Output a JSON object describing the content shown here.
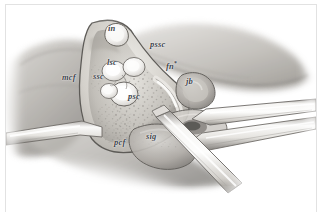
{
  "figure": {
    "style": "grayscale medical illustration",
    "border_color": "#e2e2e2",
    "background_color": "#ffffff"
  },
  "labels": [
    {
      "id": "in",
      "text": "in",
      "meaning": "incus",
      "x": 108,
      "y": 24
    },
    {
      "id": "pssc",
      "text": "pssc",
      "meaning": "posterior semicircular canal",
      "x": 150,
      "y": 40
    },
    {
      "id": "lsc",
      "text": "lsc",
      "meaning": "lateral semicircular canal",
      "x": 107,
      "y": 58
    },
    {
      "id": "mcf",
      "text": "mcf",
      "meaning": "middle cranial fossa",
      "x": 62,
      "y": 73
    },
    {
      "id": "ssc",
      "text": "ssc",
      "meaning": "superior semicircular canal",
      "x": 93,
      "y": 72
    },
    {
      "id": "fn",
      "text": "fn",
      "sup": "*",
      "meaning": "facial nerve",
      "x": 166,
      "y": 62
    },
    {
      "id": "jb",
      "text": "jb",
      "meaning": "jugular bulb",
      "x": 186,
      "y": 77
    },
    {
      "id": "psc",
      "text": "psc",
      "meaning": "posterior semicircular canal",
      "x": 128,
      "y": 92
    },
    {
      "id": "pcf",
      "text": "pcf",
      "meaning": "posterior cranial fossa",
      "x": 114,
      "y": 138
    },
    {
      "id": "sig",
      "text": "sig",
      "meaning": "sigmoid sinus",
      "x": 146,
      "y": 132
    }
  ],
  "palette": {
    "bone_light": "#e8e6e2",
    "bone_mid": "#c9c6c0",
    "bone_shadow": "#9b9792",
    "soft_tissue_light": "#dcdad6",
    "soft_tissue_mid": "#b6b3ae",
    "soft_tissue_dark": "#7d7a76",
    "instrument_light": "#f2f1ef",
    "instrument_mid": "#cfcdc9",
    "instrument_edge": "#6e6b67",
    "outline": "#4a4946",
    "canal_highlight": "#fbfbfa",
    "label_color": "#3d4349"
  }
}
